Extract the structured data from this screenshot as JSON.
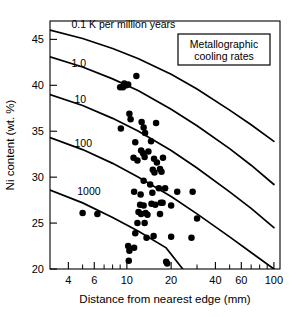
{
  "chart_data": {
    "type": "scatter",
    "title": "",
    "xlabel": "Distance from nearest edge (mm)",
    "ylabel": "Ni content (wt. %)",
    "xscale": "log",
    "yscale": "linear",
    "xlim": [
      3,
      110
    ],
    "ylim": [
      20,
      47
    ],
    "grid": false,
    "xticks": [
      4,
      6,
      10,
      20,
      40,
      60,
      100
    ],
    "xtick_labels": [
      "4",
      "6",
      "10",
      "20",
      "40",
      "60",
      "100"
    ],
    "xminor_ticks": [
      3,
      4,
      5,
      6,
      7,
      8,
      9,
      10,
      20,
      30,
      40,
      50,
      60,
      70,
      80,
      90,
      100
    ],
    "yticks": [
      20,
      25,
      30,
      35,
      40,
      45
    ],
    "ytick_labels": [
      "20",
      "25",
      "30",
      "35",
      "40",
      "45"
    ],
    "legend_position": "top-right",
    "legend_title": "Metallographic cooling rates",
    "legend_lines": [
      "Metallographic",
      "cooling rates"
    ],
    "annotations": [
      {
        "text": "0.1 K per million years",
        "x": 4.2,
        "y": 46.2
      },
      {
        "text": "1.0",
        "x": 4.2,
        "y": 42.0
      },
      {
        "text": "10",
        "x": 4.4,
        "y": 38.1
      },
      {
        "text": "100",
        "x": 4.4,
        "y": 33.3
      },
      {
        "text": "1000",
        "x": 4.6,
        "y": 28.1
      }
    ],
    "series": [
      {
        "name": "0.1 K per million years",
        "type": "line",
        "label": "0.1",
        "points": [
          [
            3.0,
            46.0
          ],
          [
            5,
            45.1
          ],
          [
            8,
            44.0
          ],
          [
            12,
            42.9
          ],
          [
            20,
            41.2
          ],
          [
            30,
            39.6
          ],
          [
            50,
            37.3
          ],
          [
            70,
            35.7
          ],
          [
            100,
            33.9
          ]
        ]
      },
      {
        "name": "1.0 K per million years",
        "type": "line",
        "label": "1.0",
        "points": [
          [
            3.0,
            43.1
          ],
          [
            5,
            42.0
          ],
          [
            8,
            40.7
          ],
          [
            12,
            39.4
          ],
          [
            20,
            37.4
          ],
          [
            30,
            35.6
          ],
          [
            50,
            33.1
          ],
          [
            70,
            31.3
          ],
          [
            100,
            29.2
          ]
        ]
      },
      {
        "name": "10 K per million years",
        "type": "line",
        "label": "10",
        "points": [
          [
            3.0,
            39.0
          ],
          [
            5,
            37.8
          ],
          [
            8,
            36.4
          ],
          [
            12,
            35.0
          ],
          [
            20,
            32.9
          ],
          [
            30,
            31.0
          ],
          [
            50,
            28.4
          ],
          [
            70,
            26.6
          ],
          [
            100,
            24.5
          ]
        ]
      },
      {
        "name": "100 K per million years",
        "type": "line",
        "label": "100",
        "points": [
          [
            3.0,
            34.3
          ],
          [
            5,
            33.0
          ],
          [
            8,
            31.5
          ],
          [
            12,
            30.0
          ],
          [
            20,
            27.9
          ],
          [
            30,
            26.0
          ],
          [
            50,
            23.5
          ],
          [
            70,
            21.8
          ],
          [
            100,
            20.0
          ]
        ]
      },
      {
        "name": "1000 K per million years",
        "type": "line",
        "label": "1000",
        "points": [
          [
            3.0,
            28.6
          ],
          [
            5,
            27.2
          ],
          [
            8,
            25.6
          ],
          [
            12,
            24.1
          ],
          [
            18.5,
            22.3
          ],
          [
            24,
            20.0
          ]
        ]
      },
      {
        "name": "Measured meteorite samples",
        "type": "scatter",
        "marker": "filled-circle",
        "points": [
          [
            9.0,
            39.8
          ],
          [
            9.4,
            39.8
          ],
          [
            9.6,
            40.2
          ],
          [
            9.9,
            40.0
          ],
          [
            10.2,
            40.1
          ],
          [
            11.6,
            41.0
          ],
          [
            10.4,
            36.9
          ],
          [
            10.6,
            36.3
          ],
          [
            9.1,
            35.3
          ],
          [
            12.6,
            36.0
          ],
          [
            13.0,
            35.4
          ],
          [
            15.8,
            35.9
          ],
          [
            13.3,
            34.8
          ],
          [
            11.4,
            33.8
          ],
          [
            14.6,
            33.9
          ],
          [
            12.5,
            32.9
          ],
          [
            12.9,
            32.6
          ],
          [
            13.2,
            32.2
          ],
          [
            14.0,
            32.8
          ],
          [
            11.1,
            32.1
          ],
          [
            11.8,
            31.8
          ],
          [
            15.3,
            32.0
          ],
          [
            16.0,
            31.6
          ],
          [
            17.6,
            32.1
          ],
          [
            15.0,
            30.8
          ],
          [
            15.4,
            30.5
          ],
          [
            16.8,
            30.9
          ],
          [
            17.2,
            30.6
          ],
          [
            13.0,
            29.6
          ],
          [
            14.4,
            29.2
          ],
          [
            11.2,
            28.4
          ],
          [
            12.4,
            28.1
          ],
          [
            14.9,
            28.3
          ],
          [
            16.5,
            28.8
          ],
          [
            18.2,
            28.8
          ],
          [
            22.0,
            28.4
          ],
          [
            28.0,
            28.4
          ],
          [
            12.3,
            27.0
          ],
          [
            13.0,
            26.9
          ],
          [
            14.7,
            27.1
          ],
          [
            15.6,
            27.0
          ],
          [
            17.0,
            27.2
          ],
          [
            17.5,
            27.2
          ],
          [
            20.0,
            26.9
          ],
          [
            12.0,
            26.2
          ],
          [
            12.5,
            26.0
          ],
          [
            13.4,
            26.1
          ],
          [
            13.8,
            25.9
          ],
          [
            16.8,
            26.0
          ],
          [
            5.0,
            26.1
          ],
          [
            6.3,
            26.0
          ],
          [
            11.8,
            25.0
          ],
          [
            13.2,
            25.0
          ],
          [
            11.4,
            23.9
          ],
          [
            13.6,
            23.4
          ],
          [
            15.2,
            23.6
          ],
          [
            20.0,
            23.5
          ],
          [
            27.5,
            23.4
          ],
          [
            30.0,
            25.5
          ],
          [
            10.2,
            22.5
          ],
          [
            10.4,
            22.0
          ],
          [
            11.2,
            22.3
          ],
          [
            10.3,
            20.9
          ],
          [
            18.5,
            20.8
          ],
          [
            18.8,
            20.6
          ]
        ]
      }
    ]
  }
}
